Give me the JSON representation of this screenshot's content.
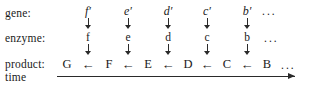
{
  "figure": {
    "type": "pathway-diagram",
    "background_color": "#ffffff",
    "ink_color": "#1a1a1a",
    "row_labels": {
      "gene": "gene:",
      "enzyme": "enzyme:",
      "product": "product:",
      "time": "time"
    },
    "ellipsis": "...",
    "columns": [
      {
        "gene": "f′",
        "enzyme": "f",
        "product": "F"
      },
      {
        "gene": "e′",
        "enzyme": "e",
        "product": "E"
      },
      {
        "gene": "d′",
        "enzyme": "d",
        "product": "D"
      },
      {
        "gene": "c′",
        "enzyme": "c",
        "product": "C"
      },
      {
        "gene": "b′",
        "enzyme": "b",
        "product": "B"
      }
    ],
    "terminal_product": "G",
    "product_arrow": "←",
    "vertical_arrow": "↓",
    "time_arrow_direction": "right"
  }
}
